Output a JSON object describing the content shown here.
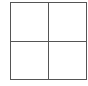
{
  "diagram": {
    "type": "grid",
    "rows": 2,
    "columns": 2,
    "line_color": "#555555",
    "background": "#ffffff",
    "cells": [
      {
        "row": 0,
        "col": 0,
        "label": ""
      },
      {
        "row": 0,
        "col": 1,
        "label": ""
      },
      {
        "row": 1,
        "col": 0,
        "label": ""
      },
      {
        "row": 1,
        "col": 1,
        "label": ""
      }
    ]
  }
}
